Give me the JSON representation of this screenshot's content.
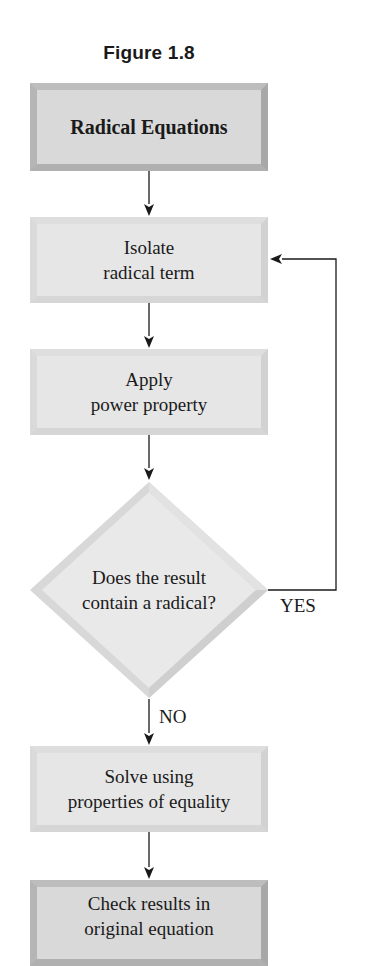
{
  "figure": {
    "title": "Figure 1.8"
  },
  "flowchart": {
    "start": {
      "label": "Radical Equations"
    },
    "steps": [
      {
        "line1": "Isolate",
        "line2": "radical term"
      },
      {
        "line1": "Apply",
        "line2": "power property"
      }
    ],
    "decision": {
      "line1": "Does the result",
      "line2": "contain a radical?",
      "yes_label": "YES",
      "no_label": "NO"
    },
    "solve": {
      "line1": "Solve using",
      "line2": "properties of equality"
    },
    "end": {
      "line1": "Check results in",
      "line2": "original equation"
    }
  },
  "colors": {
    "box_fill": "#e4e4e4",
    "box_bevel": "#c9c9c9",
    "end_box_bevel": "#b0b0b0",
    "line": "#1a1a1a"
  }
}
